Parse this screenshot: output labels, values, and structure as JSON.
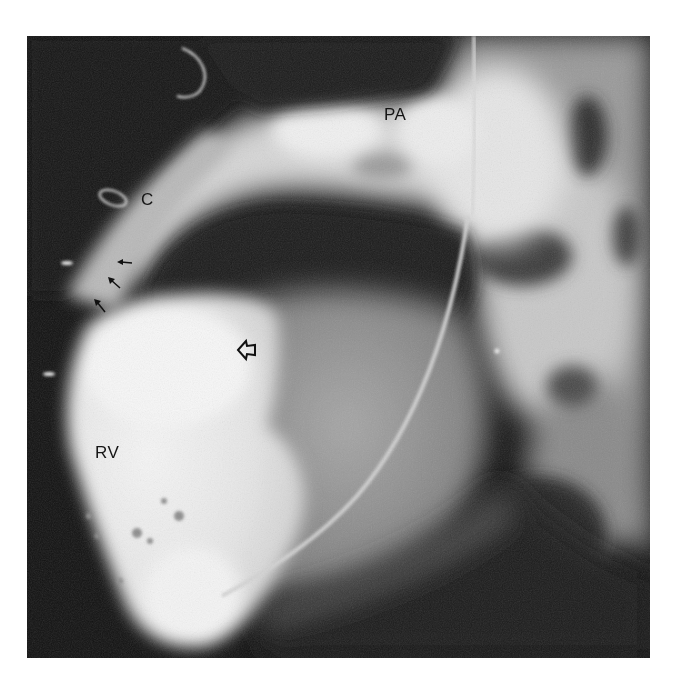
{
  "figure": {
    "labels": {
      "pa": "PA",
      "c": "C",
      "rv": "RV"
    },
    "annotations": {
      "small_arrows": [
        {
          "x": 117,
          "y": 258,
          "direction": "left"
        },
        {
          "x": 113,
          "y": 284,
          "direction": "up-left"
        },
        {
          "x": 97,
          "y": 306,
          "direction": "up-left"
        }
      ],
      "open_arrow": {
        "x": 245,
        "y": 350,
        "direction": "left"
      }
    },
    "colors": {
      "background": "#ffffff",
      "film_dark": "#111111",
      "contrast_bright": "#f2f2f2",
      "label_text": "#151515"
    }
  }
}
